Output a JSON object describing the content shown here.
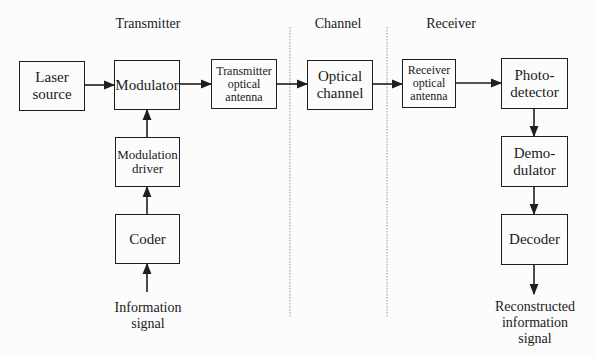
{
  "diagram": {
    "sections": {
      "transmitter": "Transmitter",
      "channel": "Channel",
      "receiver": "Receiver"
    },
    "blocks": {
      "laser_source": "Laser\nsource",
      "modulator": "Modulator",
      "tx_antenna": "Transmitter\noptical\nantenna",
      "optical_channel": "Optical\nchannel",
      "rx_antenna": "Receiver\noptical\nantenna",
      "photodetector": "Photo-\ndetector",
      "modulation_driver": "Modulation\ndriver",
      "coder": "Coder",
      "demodulator": "Demo-\ndulator",
      "decoder": "Decoder"
    },
    "io_labels": {
      "input": "Information\nsignal",
      "output": "Reconstructed\ninformation\nsignal"
    },
    "connections": [
      {
        "from": "laser_source",
        "to": "modulator"
      },
      {
        "from": "modulator",
        "to": "tx_antenna"
      },
      {
        "from": "tx_antenna",
        "to": "optical_channel"
      },
      {
        "from": "optical_channel",
        "to": "rx_antenna"
      },
      {
        "from": "rx_antenna",
        "to": "photodetector"
      },
      {
        "from": "photodetector",
        "to": "demodulator"
      },
      {
        "from": "demodulator",
        "to": "decoder"
      },
      {
        "from": "decoder",
        "to": "output"
      },
      {
        "from": "input",
        "to": "coder"
      },
      {
        "from": "coder",
        "to": "modulation_driver"
      },
      {
        "from": "modulation_driver",
        "to": "modulator"
      }
    ],
    "line_color": "#1e1e1e",
    "divider_color": "#9a9a9a"
  }
}
